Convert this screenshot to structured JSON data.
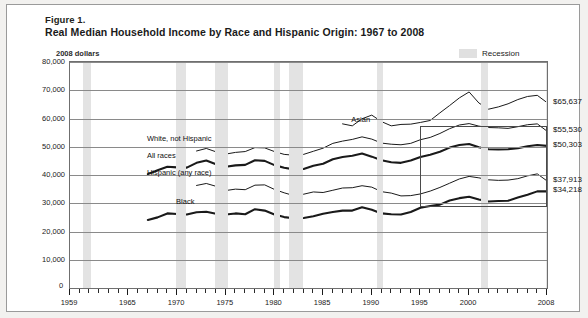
{
  "figure": {
    "number": "Figure 1.",
    "title": "Real Median Household Income by Race and Hispanic Origin: 1967 to 2008",
    "units_note": "2008 dollars"
  },
  "legend": {
    "recession_label": "Recession",
    "recession_color": "#e3e3e3"
  },
  "value_labels": [
    {
      "text": "$65,637",
      "series": "Asian"
    },
    {
      "text": "$55,530",
      "series": "White, not Hispanic"
    },
    {
      "text": "$50,303",
      "series": "All races"
    },
    {
      "text": "$37,913",
      "series": "Hispanic (any race)"
    },
    {
      "text": "$34,218",
      "series": "Black"
    }
  ],
  "chart_data": {
    "type": "line",
    "title": "Real Median Household Income by Race and Hispanic Origin: 1967 to 2008",
    "subtitle": "Figure 1.",
    "xlabel": "",
    "ylabel": "2008 dollars",
    "xlim": [
      1959,
      2008
    ],
    "ylim": [
      0,
      80000
    ],
    "ytick_labels": [
      "0",
      "10,000",
      "20,000",
      "30,000",
      "40,000",
      "50,000",
      "60,000",
      "70,000",
      "80,000"
    ],
    "yticks": [
      0,
      10000,
      20000,
      30000,
      40000,
      50000,
      60000,
      70000,
      80000
    ],
    "xtick_labels": [
      "1959",
      "1965",
      "1970",
      "1975",
      "1980",
      "1985",
      "1990",
      "1995",
      "2000",
      "2008"
    ],
    "xticks": [
      1959,
      1965,
      1970,
      1975,
      1980,
      1985,
      1990,
      1995,
      2000,
      2008
    ],
    "grid": true,
    "legend_position": "top-right",
    "annotations": [
      {
        "text": "Asian",
        "x": 1988,
        "y": 59000
      },
      {
        "text": "White, not Hispanic",
        "x": 1967,
        "y": 52500
      },
      {
        "text": "All races",
        "x": 1967,
        "y": 46500
      },
      {
        "text": "Hispanic (any race)",
        "x": 1967,
        "y": 40500
      },
      {
        "text": "Black",
        "x": 1970,
        "y": 30000
      }
    ],
    "highlight_box": {
      "x0": 1995,
      "x1": 2008,
      "y0": 28500,
      "y1": 57500
    },
    "recession_bands": [
      [
        1960.3,
        1961.2
      ],
      [
        1969.9,
        1970.9
      ],
      [
        1973.9,
        1975.2
      ],
      [
        1980.0,
        1980.6
      ],
      [
        1981.5,
        1982.9
      ],
      [
        1990.5,
        1991.2
      ],
      [
        2001.2,
        2001.9
      ],
      [
        2007.9,
        2008.5
      ]
    ],
    "series": [
      {
        "name": "Asian",
        "line": "thin-dark",
        "x": [
          1987,
          1988,
          1989,
          1990,
          1991,
          1992,
          1993,
          1994,
          1995,
          1996,
          1997,
          1998,
          1999,
          2000,
          2001,
          2002,
          2003,
          2004,
          2005,
          2006,
          2007,
          2008
        ],
        "values": [
          58100,
          57400,
          59900,
          61200,
          58900,
          57400,
          57900,
          58000,
          58600,
          59300,
          62000,
          64600,
          67300,
          69400,
          65500,
          63300,
          64100,
          65200,
          66700,
          67800,
          68200,
          65637
        ]
      },
      {
        "name": "White, not Hispanic",
        "line": "thin-dark",
        "x": [
          1972,
          1973,
          1974,
          1975,
          1976,
          1977,
          1978,
          1979,
          1980,
          1981,
          1982,
          1983,
          1984,
          1985,
          1986,
          1987,
          1988,
          1989,
          1990,
          1991,
          1992,
          1993,
          1994,
          1995,
          1996,
          1997,
          1998,
          1999,
          2000,
          2001,
          2002,
          2003,
          2004,
          2005,
          2006,
          2007,
          2008
        ],
        "values": [
          48500,
          49400,
          48200,
          47400,
          48000,
          48300,
          49700,
          49600,
          48300,
          47300,
          47000,
          47300,
          48400,
          49500,
          51200,
          52000,
          52600,
          53500,
          52700,
          51300,
          50900,
          50700,
          51200,
          52500,
          53300,
          54700,
          56400,
          57700,
          58200,
          57300,
          56800,
          56700,
          56500,
          57100,
          57800,
          58100,
          55530
        ]
      },
      {
        "name": "All races",
        "line": "thick-dark",
        "x": [
          1967,
          1968,
          1969,
          1970,
          1971,
          1972,
          1973,
          1974,
          1975,
          1976,
          1977,
          1978,
          1979,
          1980,
          1981,
          1982,
          1983,
          1984,
          1985,
          1986,
          1987,
          1988,
          1989,
          1990,
          1991,
          1992,
          1993,
          1994,
          1995,
          1996,
          1997,
          1998,
          1999,
          2000,
          2001,
          2002,
          2003,
          2004,
          2005,
          2006,
          2007,
          2008
        ],
        "values": [
          40300,
          41700,
          42900,
          42700,
          42600,
          44300,
          45100,
          43800,
          42900,
          43400,
          43600,
          45200,
          45000,
          43500,
          42600,
          42000,
          42100,
          43300,
          44000,
          45600,
          46400,
          46800,
          47600,
          46500,
          45200,
          44500,
          44300,
          45100,
          46400,
          47200,
          48200,
          49700,
          50600,
          51000,
          49800,
          49100,
          49000,
          49100,
          49500,
          50200,
          50600,
          50303
        ]
      },
      {
        "name": "Hispanic (any race)",
        "line": "thin-dark",
        "x": [
          1972,
          1973,
          1974,
          1975,
          1976,
          1977,
          1978,
          1979,
          1980,
          1981,
          1982,
          1983,
          1984,
          1985,
          1986,
          1987,
          1988,
          1989,
          1990,
          1991,
          1992,
          1993,
          1994,
          1995,
          1996,
          1997,
          1998,
          1999,
          2000,
          2001,
          2002,
          2003,
          2004,
          2005,
          2006,
          2007,
          2008
        ],
        "values": [
          36300,
          37000,
          36000,
          34500,
          35000,
          34800,
          36400,
          36500,
          34900,
          33700,
          32700,
          33200,
          34000,
          33800,
          34600,
          35400,
          35500,
          36200,
          35700,
          34100,
          33600,
          32600,
          32700,
          33300,
          34300,
          35600,
          37100,
          38600,
          39500,
          39000,
          38300,
          38100,
          38200,
          38700,
          39700,
          40400,
          37913
        ]
      },
      {
        "name": "Black",
        "line": "thick-dark",
        "x": [
          1967,
          1968,
          1969,
          1970,
          1971,
          1972,
          1973,
          1974,
          1975,
          1976,
          1977,
          1978,
          1979,
          1980,
          1981,
          1982,
          1983,
          1984,
          1985,
          1986,
          1987,
          1988,
          1989,
          1990,
          1991,
          1992,
          1993,
          1994,
          1995,
          1996,
          1997,
          1998,
          1999,
          2000,
          2001,
          2002,
          2003,
          2004,
          2005,
          2006,
          2007,
          2008
        ],
        "values": [
          24100,
          25000,
          26400,
          26200,
          26000,
          26800,
          27000,
          26300,
          26000,
          26400,
          26100,
          27900,
          27400,
          26000,
          25100,
          24700,
          24800,
          25400,
          26300,
          26900,
          27400,
          27400,
          28600,
          27700,
          26400,
          26100,
          26000,
          26900,
          28400,
          29000,
          29500,
          31000,
          31800,
          32300,
          31300,
          30600,
          30800,
          30900,
          32000,
          33000,
          34200,
          34218
        ]
      }
    ]
  }
}
